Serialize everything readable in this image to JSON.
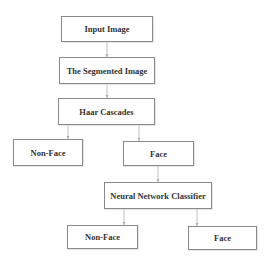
{
  "diagram": {
    "type": "flowchart",
    "nodes": [
      {
        "id": "input",
        "label": "Input Image"
      },
      {
        "id": "segmented",
        "label": "The Segmented Image"
      },
      {
        "id": "haar",
        "label": "Haar Cascades"
      },
      {
        "id": "nonface1",
        "label": "Non-Face"
      },
      {
        "id": "face1",
        "label": "Face"
      },
      {
        "id": "nn",
        "label": "Neural Network Classifier"
      },
      {
        "id": "nonface2",
        "label": "Non-Face"
      },
      {
        "id": "face2",
        "label": "Face"
      }
    ],
    "edges": [
      {
        "from": "input",
        "to": "segmented"
      },
      {
        "from": "segmented",
        "to": "haar"
      },
      {
        "from": "haar",
        "to": "nonface1"
      },
      {
        "from": "haar",
        "to": "face1"
      },
      {
        "from": "face1",
        "to": "nn"
      },
      {
        "from": "nn",
        "to": "nonface2"
      },
      {
        "from": "nn",
        "to": "face2"
      }
    ]
  }
}
